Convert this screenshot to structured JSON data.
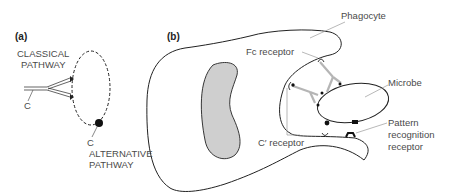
{
  "panels": {
    "a": {
      "label": "(a)",
      "classical_line1": "CLASSICAL",
      "classical_line2": "PATHWAY",
      "c_left": "C",
      "c_bottom": "C",
      "alternative_line1": "ALTERNATIVE",
      "alternative_line2": "PATHWAY"
    },
    "b": {
      "label": "(b)",
      "phagocyte": "Phagocyte",
      "fc_receptor": "Fc receptor",
      "microbe": "Microbe",
      "c_receptor": "C′ receptor",
      "prr_line1": "Pattern",
      "prr_line2": "recognition",
      "prr_line3": "receptor"
    }
  },
  "colors": {
    "line": "#222222",
    "leader": "#9a9a9a",
    "nucleus_fill": "#cfcfcf",
    "antibody": "#b5b5b5",
    "text": "#4a4a4a"
  }
}
